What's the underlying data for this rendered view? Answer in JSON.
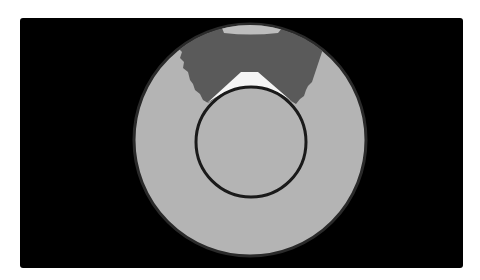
{
  "image": {
    "description": "Grayscale circular cross-section phantom/scan image on black background",
    "frame": {
      "x": 20,
      "y": 18,
      "width": 443,
      "height": 250,
      "background": "#000000"
    },
    "outer_disk": {
      "cx": 250,
      "cy": 140,
      "r": 116,
      "fill": "#b4b4b4",
      "rim": "#2a2a2a"
    },
    "inner_ring": {
      "cx": 251,
      "cy": 142,
      "r": 55,
      "stroke": "#1a1a1a",
      "stroke_width": 3
    },
    "dark_region": {
      "fill": "#5a5a5a"
    },
    "bright_wedge": {
      "fill": "#f5f5f5"
    },
    "top_cap": {
      "fill": "#bdbdbd"
    },
    "colors": {
      "background": "#ffffff",
      "black": "#000000",
      "light_gray": "#b4b4b4",
      "dark_gray": "#5a5a5a",
      "white": "#f5f5f5"
    }
  }
}
